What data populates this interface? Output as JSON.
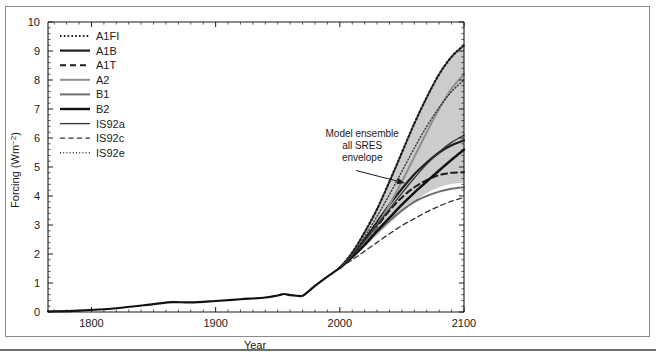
{
  "chart_data": {
    "type": "line",
    "title": "",
    "xlabel": "Year",
    "ylabel": "Forcing (Wm−2)",
    "xlim": [
      1765,
      2100
    ],
    "ylim": [
      0,
      10
    ],
    "xticks": [
      1800,
      1900,
      2000,
      2100
    ],
    "xtick_labels": [
      "1800",
      "1900",
      "2000",
      "2100"
    ],
    "yticks": [
      0,
      1,
      2,
      3,
      4,
      5,
      6,
      7,
      8,
      9,
      10
    ],
    "ytick_labels": [
      "0",
      "1",
      "2",
      "3",
      "4",
      "5",
      "6",
      "7",
      "8",
      "9",
      "10"
    ],
    "minor_ticks": true,
    "grid": false,
    "legend_position": "top-left",
    "annotations": [
      {
        "name": "sres-envelope-annotation",
        "text_lines": [
          "Model ensemble",
          "all SRES",
          "envelope"
        ],
        "x": 2018,
        "y": 6.05,
        "arrow_to_x": 2052,
        "arrow_to_y": 4.45
      }
    ],
    "bands": [
      {
        "name": "Model ensemble all SRES envelope",
        "fill": "#cccccc",
        "x": [
          2000,
          2010,
          2020,
          2030,
          2040,
          2050,
          2060,
          2070,
          2080,
          2090,
          2100
        ],
        "upper": [
          1.55,
          2.1,
          2.8,
          3.6,
          4.55,
          5.55,
          6.55,
          7.45,
          8.25,
          8.85,
          9.25
        ],
        "lower": [
          1.5,
          1.85,
          2.25,
          2.65,
          3.05,
          3.45,
          3.8,
          4.1,
          4.3,
          4.42,
          4.45
        ]
      }
    ],
    "historical": {
      "name": "Historical forcing",
      "style": "solid",
      "width": 2.2,
      "color": "#111111",
      "x": [
        1765,
        1790,
        1820,
        1850,
        1865,
        1880,
        1900,
        1920,
        1940,
        1950,
        1955,
        1960,
        1965,
        1970,
        1975,
        1980,
        1990,
        2000
      ],
      "y": [
        0.02,
        0.05,
        0.13,
        0.27,
        0.34,
        0.33,
        0.38,
        0.44,
        0.5,
        0.57,
        0.62,
        0.58,
        0.56,
        0.56,
        0.72,
        0.9,
        1.22,
        1.52
      ]
    },
    "series": [
      {
        "name": "A1FI",
        "label": "A1FI",
        "style": "dotted",
        "color": "#1d1d1d",
        "width": 2.2,
        "x": [
          2000,
          2010,
          2020,
          2030,
          2040,
          2050,
          2060,
          2070,
          2080,
          2090,
          2100
        ],
        "y": [
          1.52,
          2.05,
          2.75,
          3.55,
          4.5,
          5.5,
          6.5,
          7.4,
          8.2,
          8.8,
          9.2
        ]
      },
      {
        "name": "A1B",
        "label": "A1B",
        "style": "solid",
        "color": "#1d1d1d",
        "width": 2.2,
        "x": [
          2000,
          2010,
          2020,
          2030,
          2040,
          2050,
          2060,
          2070,
          2080,
          2090,
          2100
        ],
        "y": [
          1.52,
          1.95,
          2.5,
          3.1,
          3.7,
          4.25,
          4.75,
          5.15,
          5.5,
          5.75,
          5.92
        ]
      },
      {
        "name": "A1T",
        "label": "A1T",
        "style": "dashed",
        "color": "#1d1d1d",
        "width": 2.0,
        "x": [
          2000,
          2010,
          2020,
          2030,
          2040,
          2050,
          2060,
          2070,
          2080,
          2090,
          2100
        ],
        "y": [
          1.52,
          1.92,
          2.4,
          2.95,
          3.5,
          3.95,
          4.3,
          4.55,
          4.72,
          4.8,
          4.82
        ]
      },
      {
        "name": "A2",
        "label": "A2",
        "style": "solid",
        "color": "#8f8f8f",
        "width": 2.0,
        "x": [
          2000,
          2010,
          2020,
          2030,
          2040,
          2050,
          2060,
          2070,
          2080,
          2090,
          2100
        ],
        "y": [
          1.52,
          1.92,
          2.4,
          3.0,
          3.7,
          4.5,
          5.35,
          6.2,
          7.0,
          7.7,
          8.2
        ]
      },
      {
        "name": "B1",
        "label": "B1",
        "style": "solid",
        "color": "#6e6e6e",
        "width": 2.0,
        "x": [
          2000,
          2010,
          2020,
          2030,
          2040,
          2050,
          2060,
          2070,
          2080,
          2090,
          2100
        ],
        "y": [
          1.52,
          1.88,
          2.3,
          2.75,
          3.15,
          3.5,
          3.8,
          4.0,
          4.15,
          4.25,
          4.3
        ]
      },
      {
        "name": "B2",
        "label": "B2",
        "style": "solid",
        "color": "#111111",
        "width": 2.4,
        "x": [
          2000,
          2010,
          2020,
          2030,
          2040,
          2050,
          2060,
          2070,
          2080,
          2090,
          2100
        ],
        "y": [
          1.52,
          1.9,
          2.32,
          2.8,
          3.25,
          3.7,
          4.12,
          4.5,
          4.88,
          5.25,
          5.6
        ]
      },
      {
        "name": "IS92a",
        "label": "IS92a",
        "style": "solid",
        "color": "#333333",
        "width": 1.3,
        "x": [
          2000,
          2010,
          2020,
          2030,
          2040,
          2050,
          2060,
          2070,
          2080,
          2090,
          2100
        ],
        "y": [
          1.52,
          1.95,
          2.45,
          3.0,
          3.55,
          4.1,
          4.62,
          5.1,
          5.52,
          5.85,
          6.1
        ]
      },
      {
        "name": "IS92c",
        "label": "IS92c",
        "style": "dashed",
        "color": "#333333",
        "width": 1.3,
        "x": [
          2000,
          2010,
          2020,
          2030,
          2040,
          2050,
          2060,
          2070,
          2080,
          2090,
          2100
        ],
        "y": [
          1.52,
          1.8,
          2.1,
          2.4,
          2.7,
          2.98,
          3.22,
          3.45,
          3.65,
          3.82,
          3.95
        ]
      },
      {
        "name": "IS92e",
        "label": "IS92e",
        "style": "dotted",
        "color": "#333333",
        "width": 1.4,
        "x": [
          2000,
          2010,
          2020,
          2030,
          2040,
          2050,
          2060,
          2070,
          2080,
          2090,
          2100
        ],
        "y": [
          1.52,
          2.0,
          2.6,
          3.3,
          4.05,
          4.85,
          5.65,
          6.4,
          7.05,
          7.6,
          8.0
        ]
      }
    ]
  },
  "legend": {
    "items": [
      {
        "label": "A1FI"
      },
      {
        "label": "A1B"
      },
      {
        "label": "A1T"
      },
      {
        "label": "A2"
      },
      {
        "label": "B1"
      },
      {
        "label": "B2"
      },
      {
        "label": "IS92a"
      },
      {
        "label": "IS92c"
      },
      {
        "label": "IS92e"
      }
    ]
  },
  "axes": {
    "x_title": "Year",
    "y_title": "Forcing (Wm−2)"
  },
  "colors": {
    "envelope_fill": "#cccccc",
    "axis": "#1a1a1a",
    "frame": "#8a8a8a"
  }
}
